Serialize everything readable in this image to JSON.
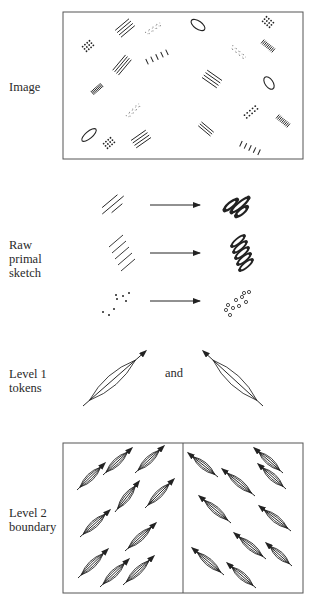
{
  "figure": {
    "colors": {
      "ink": "#222222",
      "frame": "#555555",
      "background": "#ffffff"
    },
    "rows": [
      {
        "id": "image",
        "label": "Image",
        "label_pos": [
          9,
          80
        ]
      },
      {
        "id": "raw-primal-sketch",
        "label": "Raw\nprimal\nsketch",
        "label_pos": [
          9,
          238
        ]
      },
      {
        "id": "level-1-tokens",
        "label": "Level 1\ntokens",
        "label_pos": [
          9,
          367
        ]
      },
      {
        "id": "level-2-boundary",
        "label": "Level 2\nboundary",
        "label_pos": [
          9,
          506
        ]
      }
    ],
    "connector_text": {
      "text": "and",
      "pos": [
        165,
        366
      ]
    },
    "image_panel": {
      "box": [
        63,
        12,
        240,
        147
      ],
      "elements": [
        {
          "type": "lines",
          "cx": 125,
          "cy": 28,
          "n": 4,
          "len": 18,
          "angle": -40,
          "gap": 3
        },
        {
          "type": "faint-dots",
          "cx": 153,
          "cy": 29,
          "len": 16,
          "angle": -35
        },
        {
          "type": "ellipse",
          "cx": 198,
          "cy": 25,
          "rx": 8,
          "ry": 4,
          "angle": 35
        },
        {
          "type": "dots",
          "cx": 268,
          "cy": 22,
          "rows": 4,
          "cols": 3,
          "angle": 40,
          "step": 3
        },
        {
          "type": "dots",
          "cx": 88,
          "cy": 46,
          "rows": 4,
          "cols": 3,
          "angle": -40,
          "step": 3
        },
        {
          "type": "dense-lines",
          "cx": 268,
          "cy": 46,
          "len": 14,
          "angle": 40
        },
        {
          "type": "faint-dots",
          "cx": 238,
          "cy": 52,
          "len": 16,
          "angle": 40
        },
        {
          "type": "lines",
          "cx": 122,
          "cy": 65,
          "n": 4,
          "len": 20,
          "angle": -50,
          "gap": 2.5
        },
        {
          "type": "short-ticks",
          "cx": 157,
          "cy": 57,
          "n": 5,
          "span": 22,
          "angle": -25
        },
        {
          "type": "lines",
          "cx": 212,
          "cy": 79,
          "n": 4,
          "len": 18,
          "angle": 35,
          "gap": 3
        },
        {
          "type": "ellipse",
          "cx": 269,
          "cy": 83,
          "rx": 7,
          "ry": 4,
          "angle": 55
        },
        {
          "type": "dense-lines",
          "cx": 97,
          "cy": 89,
          "len": 12,
          "angle": -40
        },
        {
          "type": "faint-dots",
          "cx": 133,
          "cy": 111,
          "len": 16,
          "angle": -45
        },
        {
          "type": "dots",
          "cx": 251,
          "cy": 112,
          "rows": 2,
          "cols": 5,
          "angle": 50,
          "step": 3.5
        },
        {
          "type": "dense-lines",
          "cx": 283,
          "cy": 121,
          "len": 14,
          "angle": 40
        },
        {
          "type": "ellipse",
          "cx": 89,
          "cy": 135,
          "rx": 9,
          "ry": 3.5,
          "angle": -40
        },
        {
          "type": "dots",
          "cx": 109,
          "cy": 143,
          "rows": 4,
          "cols": 3,
          "angle": -40,
          "step": 3
        },
        {
          "type": "lines",
          "cx": 141,
          "cy": 139,
          "n": 4,
          "len": 18,
          "angle": -35,
          "gap": 3
        },
        {
          "type": "lines",
          "cx": 206,
          "cy": 129,
          "n": 3,
          "len": 16,
          "angle": 40,
          "gap": 2.5
        },
        {
          "type": "short-ticks",
          "cx": 250,
          "cy": 148,
          "n": 5,
          "span": 20,
          "angle": 25
        }
      ]
    },
    "raw_primal_sketch": {
      "rows": [
        {
          "left": "long-lines",
          "cx": 113,
          "cy": 205,
          "right": "blob-pins",
          "rcx": 240,
          "rcy": 205
        },
        {
          "left": "stacked-lines",
          "cx": 122,
          "cy": 253,
          "right": "stacked-blobs",
          "rcx": 242,
          "rcy": 253
        },
        {
          "left": "sparse-dots",
          "cx": 120,
          "cy": 302,
          "right": "open-circles",
          "rcx": 238,
          "rcy": 303
        }
      ],
      "arrows": [
        {
          "x1": 150,
          "y1": 205,
          "x2": 200,
          "y2": 205
        },
        {
          "x1": 150,
          "y1": 253,
          "x2": 200,
          "y2": 253
        },
        {
          "x1": 150,
          "y1": 301,
          "x2": 200,
          "y2": 301
        }
      ]
    },
    "level_1_tokens": [
      {
        "x1": 83,
        "y1": 406,
        "x2": 147,
        "y2": 350,
        "arrow_at": "end"
      },
      {
        "x1": 263,
        "y1": 406,
        "x2": 202,
        "y2": 350,
        "arrow_at": "end"
      }
    ],
    "level_2_boundary": {
      "box": [
        63,
        443,
        240,
        150
      ],
      "divider_x": 183,
      "left_tokens": [
        [
          77,
          490,
          106,
          462
        ],
        [
          103,
          475,
          133,
          447
        ],
        [
          135,
          473,
          165,
          445
        ],
        [
          115,
          512,
          140,
          480
        ],
        [
          145,
          508,
          175,
          478
        ],
        [
          80,
          537,
          111,
          509
        ],
        [
          125,
          551,
          157,
          522
        ],
        [
          78,
          578,
          109,
          548
        ],
        [
          100,
          587,
          130,
          558
        ],
        [
          123,
          585,
          155,
          555
        ]
      ],
      "right_tokens": [
        [
          218,
          477,
          187,
          452
        ],
        [
          283,
          473,
          253,
          447
        ],
        [
          255,
          496,
          221,
          468
        ],
        [
          286,
          489,
          257,
          463
        ],
        [
          231,
          523,
          198,
          495
        ],
        [
          291,
          531,
          258,
          505
        ],
        [
          266,
          559,
          233,
          532
        ],
        [
          292,
          566,
          265,
          542
        ],
        [
          224,
          575,
          191,
          547
        ],
        [
          256,
          588,
          226,
          562
        ]
      ]
    }
  }
}
